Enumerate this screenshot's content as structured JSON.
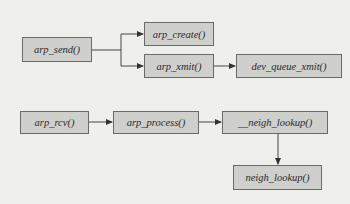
{
  "diagram": {
    "type": "call-graph",
    "colors": {
      "background": "#efefec",
      "node_fill": "#cfcfcc",
      "node_border": "#6a6a6a",
      "edge": "#333333",
      "text": "#2a2a2a"
    },
    "nodes": [
      {
        "id": "arp_send",
        "label": "arp_send()",
        "x": 22,
        "y": 37,
        "w": 70,
        "h": 25
      },
      {
        "id": "arp_create",
        "label": "arp_create()",
        "x": 144,
        "y": 22,
        "w": 70,
        "h": 24
      },
      {
        "id": "arp_xmit",
        "label": "arp_xmit()",
        "x": 144,
        "y": 54,
        "w": 70,
        "h": 24
      },
      {
        "id": "dev_queue_xmit",
        "label": "dev_queue_xmit()",
        "x": 236,
        "y": 54,
        "w": 106,
        "h": 24
      },
      {
        "id": "arp_rcv",
        "label": "arp_rcv()",
        "x": 20,
        "y": 111,
        "w": 69,
        "h": 23
      },
      {
        "id": "arp_process",
        "label": "arp_process()",
        "x": 113,
        "y": 111,
        "w": 86,
        "h": 23
      },
      {
        "id": "__neigh_lookup",
        "label": "__neigh_lookup()",
        "x": 222,
        "y": 111,
        "w": 106,
        "h": 23
      },
      {
        "id": "neigh_lookup",
        "label": "neigh_lookup()",
        "x": 233,
        "y": 165,
        "w": 89,
        "h": 25
      }
    ],
    "edges": [
      {
        "from": "arp_send",
        "to": "arp_create"
      },
      {
        "from": "arp_send",
        "to": "arp_xmit"
      },
      {
        "from": "arp_xmit",
        "to": "dev_queue_xmit"
      },
      {
        "from": "arp_rcv",
        "to": "arp_process"
      },
      {
        "from": "arp_process",
        "to": "__neigh_lookup"
      },
      {
        "from": "__neigh_lookup",
        "to": "neigh_lookup"
      }
    ]
  }
}
